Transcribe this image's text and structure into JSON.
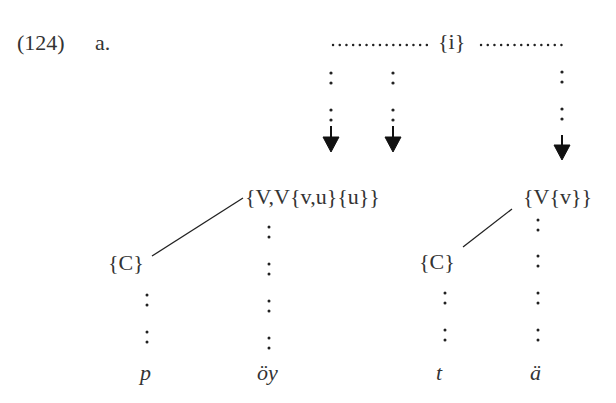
{
  "example": {
    "number": "(124)",
    "sublabel": "a."
  },
  "tier_top": {
    "label": "{i}"
  },
  "nodes": {
    "v_complex": "{V,V{v,u}{u}}",
    "v_simple": "{V{v}}",
    "c_left": "{C}",
    "c_right": "{C}"
  },
  "segments": [
    {
      "text": "p"
    },
    {
      "text": "öy"
    },
    {
      "text": "t"
    },
    {
      "text": "ä"
    }
  ],
  "colors": {
    "ink": "#222222",
    "text": "#333333",
    "background": "#ffffff"
  }
}
